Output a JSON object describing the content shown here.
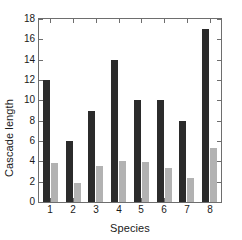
{
  "chart_data": {
    "type": "bar",
    "title": "",
    "xlabel": "Species",
    "ylabel": "Cascade length",
    "categories": [
      "1",
      "2",
      "3",
      "4",
      "5",
      "6",
      "7",
      "8"
    ],
    "series": [
      {
        "name": "dark",
        "color": "#2b2b2b",
        "values": [
          12,
          6,
          9,
          14,
          10,
          10,
          8,
          17
        ]
      },
      {
        "name": "light",
        "color": "#b2b2b2",
        "values": [
          3.8,
          1.9,
          3.5,
          4.05,
          3.95,
          3.35,
          2.4,
          5.35
        ]
      }
    ],
    "ylim": [
      0,
      18
    ],
    "yticks": [
      0,
      2,
      4,
      6,
      8,
      10,
      12,
      14,
      16,
      18
    ],
    "ytick_labels": [
      "0",
      "2",
      "4",
      "6",
      "8",
      "10",
      "12",
      "14",
      "16",
      "18"
    ],
    "xtick_labels": [
      "1",
      "2",
      "3",
      "4",
      "5",
      "6",
      "7",
      "8"
    ],
    "grid": false,
    "legend": "none",
    "axis_color": "#6e6e6e",
    "background_color": "#ffffff"
  }
}
